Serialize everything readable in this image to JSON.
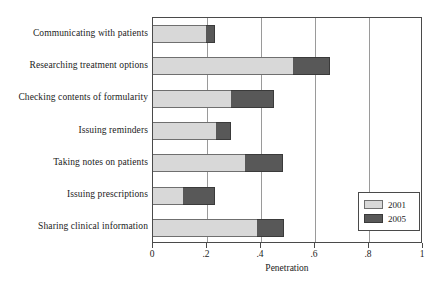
{
  "chart_data": {
    "type": "bar",
    "orientation": "horizontal",
    "stacked": true,
    "title": "",
    "xlabel": "Penetration",
    "ylabel": "",
    "xlim": [
      0,
      1
    ],
    "ylim": null,
    "grid": "vertical",
    "legend_position": "lower-right",
    "xticks": [
      {
        "value": 0,
        "label": "0"
      },
      {
        "value": 0.2,
        "label": ".2"
      },
      {
        "value": 0.4,
        "label": ".4"
      },
      {
        "value": 0.6,
        "label": ".6"
      },
      {
        "value": 0.8,
        "label": ".8"
      },
      {
        "value": 1.0,
        "label": "1"
      }
    ],
    "categories": [
      "Communicating with patients",
      "Researching treatment options",
      "Checking contents of formularity",
      "Issuing reminders",
      "Taking notes on patients",
      "Issuing prescriptions",
      "Sharing clinical information"
    ],
    "series": [
      {
        "name": "2001",
        "color": "#d8d8d8",
        "values": [
          0.195,
          0.52,
          0.29,
          0.235,
          0.34,
          0.11,
          0.385
        ]
      },
      {
        "name": "2005",
        "color": "#585858",
        "values": [
          0.035,
          0.135,
          0.16,
          0.055,
          0.14,
          0.12,
          0.1
        ]
      }
    ],
    "cumulative_totals": [
      0.23,
      0.655,
      0.45,
      0.29,
      0.48,
      0.23,
      0.485
    ]
  },
  "legend": {
    "items": [
      {
        "label": "2001",
        "swatch": "light-gray-swatch"
      },
      {
        "label": "2005",
        "swatch": "dark-gray-swatch"
      }
    ]
  },
  "axis": {
    "x_title": "Penetration"
  },
  "colors": {
    "series_2001": "#d8d8d8",
    "series_2005": "#585858",
    "frame": "#4a4a4a",
    "gridline": "#9a9a9a",
    "background": "#ffffff",
    "text": "#1b1b1b"
  }
}
